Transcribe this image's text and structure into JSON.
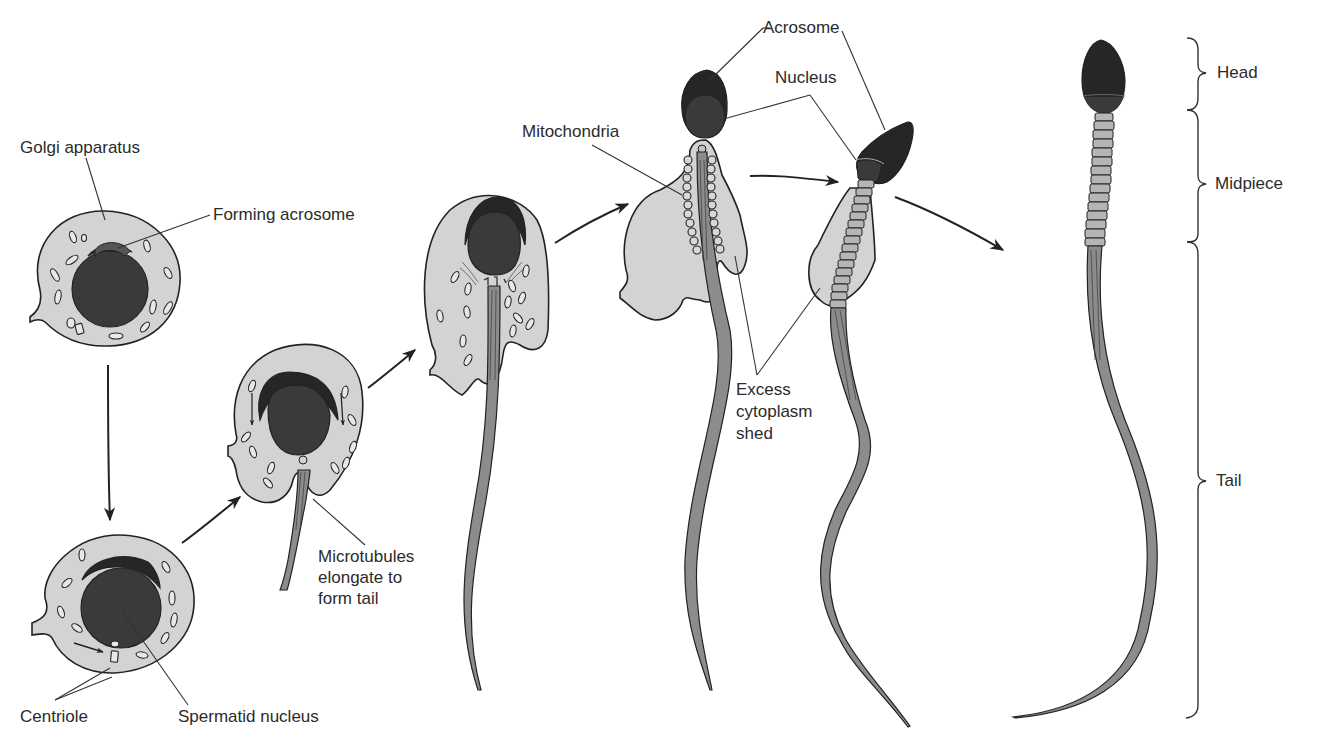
{
  "figure": {
    "colors": {
      "cytoplasm": "#d3d3d3",
      "nucleus": "#3a3a3a",
      "acrosome": "#262626",
      "outline": "#222222",
      "tail": "#8c8c8c",
      "midpiece_segment": "#b5b5b5",
      "label_text": "#2b2b2b"
    }
  },
  "labels": {
    "golgi_apparatus": "Golgi apparatus",
    "forming_acrosome": "Forming acrosome",
    "centriole": "Centriole",
    "spermatid_nucleus": "Spermatid nucleus",
    "microtubules_l1": "Microtubules",
    "microtubules_l2": "elongate to",
    "microtubules_l3": "form tail",
    "mitochondria": "Mitochondria",
    "acrosome": "Acrosome",
    "nucleus": "Nucleus",
    "excess_l1": "Excess",
    "excess_l2": "cytoplasm",
    "excess_l3": "shed",
    "head": "Head",
    "midpiece": "Midpiece",
    "tail": "Tail"
  },
  "stages": [
    {
      "id": 1,
      "name": "Spermatid with Golgi apparatus"
    },
    {
      "id": 2,
      "name": "Spermatid with acrosome cap and centrioles"
    },
    {
      "id": 3,
      "name": "Microtubules elongating to form tail"
    },
    {
      "id": 4,
      "name": "Elongating spermatid"
    },
    {
      "id": 5,
      "name": "Mitochondria arranged along midpiece"
    },
    {
      "id": 6,
      "name": "Excess cytoplasm shed"
    },
    {
      "id": 7,
      "name": "Mature sperm"
    }
  ]
}
